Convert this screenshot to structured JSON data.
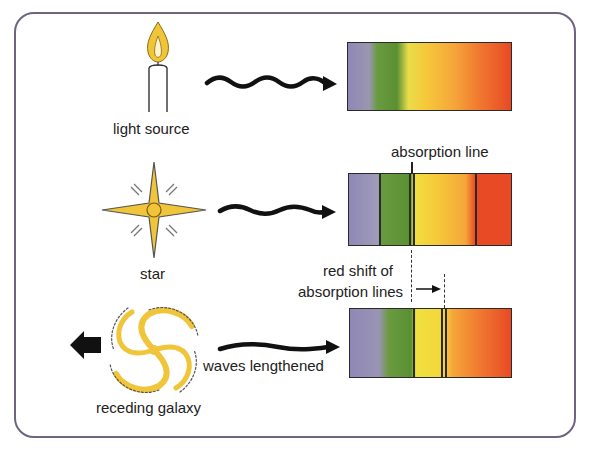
{
  "diagram": {
    "rows": [
      {
        "source": "candle",
        "label": "light source",
        "spectrum": "continuous spectrum",
        "absorption_lines": []
      },
      {
        "source": "star",
        "label": "star",
        "spectrum_annotation": "absorption line",
        "absorption_lines": [
          "green-yellow boundary"
        ]
      },
      {
        "source": "galaxy",
        "label": "receding galaxy",
        "wave_label": "waves lengthened",
        "absorption_lines": [
          "shifted toward red"
        ]
      }
    ],
    "annotations": {
      "absorption_line": "absorption line",
      "red_shift_line1": "red shift of",
      "red_shift_line2": "absorption lines",
      "waves_lengthened": "waves lengthened"
    },
    "labels": {
      "light_source": "light source",
      "star": "star",
      "receding_galaxy": "receding galaxy"
    },
    "colors": {
      "frame": "#6e6480",
      "violet": "#8a84b0",
      "green": "#5e9a3a",
      "yellow": "#f3d63a",
      "orange": "#f39a3a",
      "red": "#e84a25",
      "flame": "#f0c53a"
    }
  }
}
